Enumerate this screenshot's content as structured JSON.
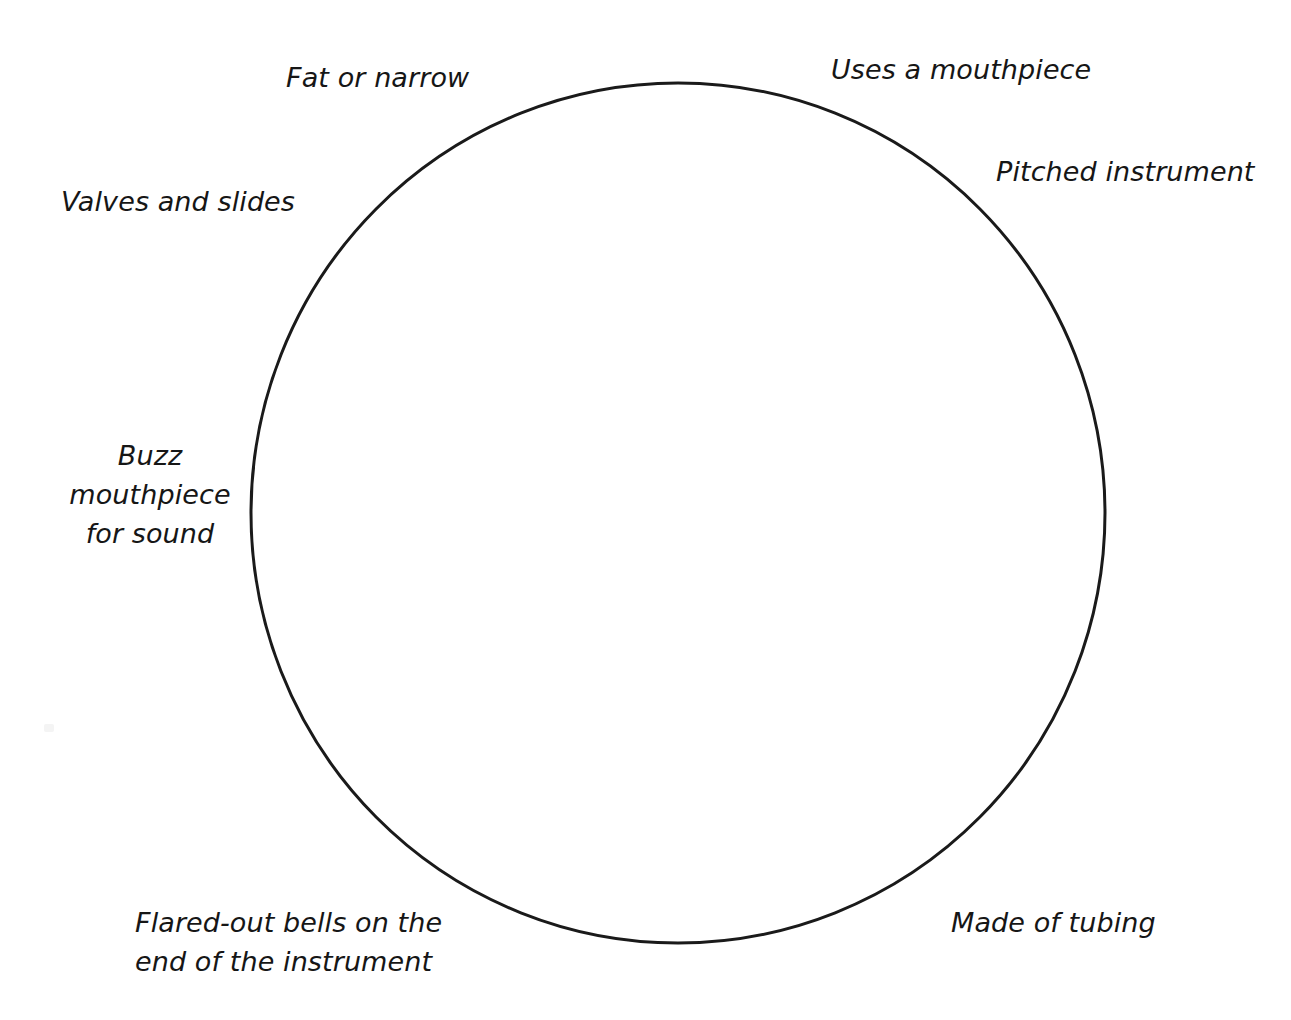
{
  "diagram": {
    "type": "concept-circle",
    "shape": {
      "name": "circle",
      "stroke_color": "#1a1a1a",
      "stroke_width": 3,
      "fill": "none",
      "center_x": 678,
      "center_y": 513,
      "radius_x": 427,
      "radius_y": 430
    },
    "background_color": "#ffffff",
    "text_color": "#161616",
    "labels": [
      {
        "id": "fat-or-narrow",
        "text": "Fat or narrow",
        "position": "top-left",
        "lines": 1
      },
      {
        "id": "uses-a-mouthpiece",
        "text": "Uses a mouthpiece",
        "position": "top-right",
        "lines": 1
      },
      {
        "id": "pitched-instrument",
        "text": "Pitched instrument",
        "position": "upper-right",
        "lines": 1
      },
      {
        "id": "valves-and-slides",
        "text": "Valves and slides",
        "position": "upper-left",
        "lines": 1
      },
      {
        "id": "buzz-mouthpiece-for-sound",
        "text": "Buzz\nmouthpiece\nfor sound",
        "position": "middle-left",
        "lines": 3
      },
      {
        "id": "flared-out-bells",
        "text": "Flared-out bells on the\nend of the instrument",
        "position": "bottom-left",
        "lines": 2
      },
      {
        "id": "made-of-tubing",
        "text": "Made of tubing",
        "position": "bottom-right",
        "lines": 1
      }
    ]
  }
}
